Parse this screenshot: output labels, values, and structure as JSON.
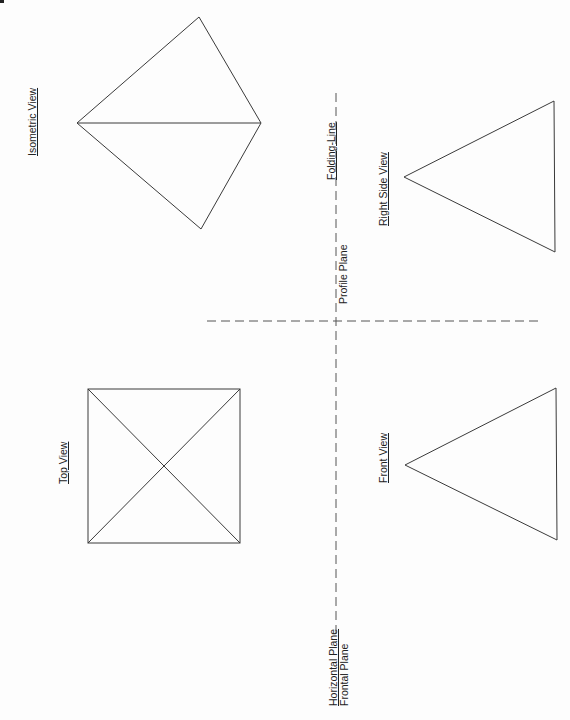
{
  "colors": {
    "stroke": "#3a3a3a",
    "background": "#fdfdfd",
    "text": "#222222"
  },
  "labels": {
    "isometric_view": "Isometric View",
    "top_view": "Top View",
    "front_view": "Front View",
    "right_side_view": "Right Side View",
    "folding_line": "Folding-Line",
    "profile_plane": "Profile Plane",
    "horizontal_plane": "Horizontal Plane",
    "frontal_plane": "Frontal Plane"
  },
  "shapes": {
    "isometric": {
      "left": [
        77,
        123
      ],
      "top": [
        199,
        17
      ],
      "right": [
        261,
        123
      ],
      "bottom": [
        201,
        229
      ]
    },
    "top_view": {
      "x1": 88,
      "y1": 389,
      "x2": 240,
      "y2": 543
    },
    "front_view": {
      "apex": [
        405,
        465
      ],
      "top_right": [
        556,
        388
      ],
      "bottom_right": [
        557,
        540
      ]
    },
    "right_side_view": {
      "apex": [
        404,
        177
      ],
      "top_right": [
        554,
        101
      ],
      "bottom_right": [
        555,
        252
      ]
    }
  },
  "folding_lines": {
    "vertical": {
      "x": 336,
      "y1": 93,
      "y2": 640
    },
    "horizontal": {
      "y": 321,
      "x1": 207,
      "x2": 540
    }
  }
}
